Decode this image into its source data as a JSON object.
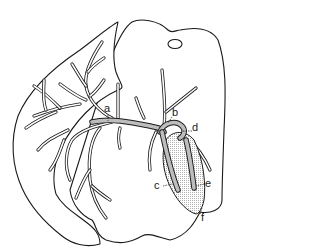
{
  "figure": {
    "colors": {
      "line": "#1a1a1a",
      "fill": "#ffffff",
      "vessel_fill": "#bdbdbd",
      "stipple": "#d0d0d0"
    }
  },
  "labels": [
    {
      "id": "a",
      "text": "a"
    },
    {
      "id": "b",
      "text": "b"
    },
    {
      "id": "c",
      "text": "c"
    },
    {
      "id": "d",
      "text": "d"
    },
    {
      "id": "e",
      "text": "e"
    },
    {
      "id": "f",
      "text": "f"
    }
  ]
}
